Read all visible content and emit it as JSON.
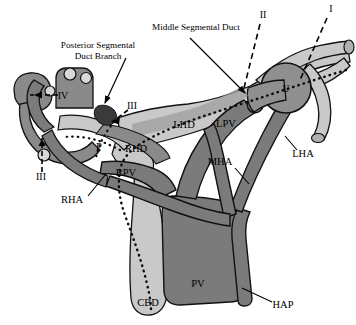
{
  "figure": {
    "background_color": "#ffffff",
    "width": 356,
    "height": 325
  },
  "colors": {
    "duct_light": "#c9c9c9",
    "duct_mid": "#b0b0b0",
    "vessel_dark": "#7b7b7b",
    "vessel_darker": "#6e6e6e",
    "outline": "#111111",
    "label_text": "#000000"
  },
  "callouts": [
    {
      "id": "posterior-segmental-duct-branch",
      "line1": "Posterior Segmental",
      "line2": "Duct Branch",
      "text_x": 98,
      "text_y": 48,
      "leader": {
        "x1": 126,
        "y1": 58,
        "x2": 103,
        "y2": 104
      }
    },
    {
      "id": "middle-segmental-duct",
      "line1": "Middle Segmental Duct",
      "line2": "",
      "text_x": 196,
      "text_y": 30,
      "leader": {
        "x1": 188,
        "y1": 38,
        "x2": 246,
        "y2": 93
      }
    }
  ],
  "roman_markers": [
    {
      "label": "I",
      "x": 331,
      "y": 12,
      "dash": {
        "x1": 327,
        "y1": 18,
        "x2": 300,
        "y2": 80
      }
    },
    {
      "label": "II",
      "x": 263,
      "y": 18,
      "dash": {
        "x1": 260,
        "y1": 24,
        "x2": 243,
        "y2": 92
      }
    },
    {
      "label": "III",
      "x": 130,
      "y": 107,
      "dash": {
        "x1": 128,
        "y1": 110,
        "x2": 112,
        "y2": 122
      }
    },
    {
      "label": "IV",
      "x": 61,
      "y": 98,
      "dash": {
        "x1": 58,
        "y1": 95,
        "x2": 32,
        "y2": 95
      }
    },
    {
      "label": "III",
      "x": 40,
      "y": 178,
      "dash": {
        "x1": 42,
        "y1": 172,
        "x2": 42,
        "y2": 140
      }
    }
  ],
  "structure_labels": [
    {
      "id": "LHD",
      "text": "LHD",
      "x": 184,
      "y": 128
    },
    {
      "id": "LPV",
      "text": "LPV",
      "x": 224,
      "y": 127
    },
    {
      "id": "LHA",
      "text": "LHA",
      "x": 300,
      "y": 155
    },
    {
      "id": "MHA",
      "text": "MHA",
      "x": 219,
      "y": 165
    },
    {
      "id": "RHD",
      "text": "RHD",
      "x": 133,
      "y": 152
    },
    {
      "id": "RPV",
      "text": "RPV",
      "x": 125,
      "y": 175
    },
    {
      "id": "RHA",
      "text": "RHA",
      "x": 72,
      "y": 202
    },
    {
      "id": "P",
      "text": "P",
      "x": 99,
      "y": 149
    },
    {
      "id": "U",
      "text": "U",
      "x": 286,
      "y": 92
    },
    {
      "id": "PV",
      "text": "PV",
      "x": 196,
      "y": 286
    },
    {
      "id": "CBD",
      "text": "CBD",
      "x": 146,
      "y": 305
    },
    {
      "id": "HAP",
      "text": "HAP",
      "x": 278,
      "y": 308
    }
  ],
  "leader_lines": [
    {
      "id": "mha-leader",
      "x1": 235,
      "y1": 168,
      "x2": 248,
      "y2": 182
    },
    {
      "id": "lha-leader",
      "x1": 297,
      "y1": 152,
      "x2": 286,
      "y2": 140
    },
    {
      "id": "rha-leader",
      "x1": 88,
      "y1": 196,
      "x2": 104,
      "y2": 176
    },
    {
      "id": "hap-leader",
      "x1": 274,
      "y1": 303,
      "x2": 243,
      "y2": 288
    }
  ]
}
